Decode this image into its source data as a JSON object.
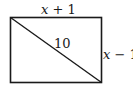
{
  "diagram": {
    "shape": "rectangle-with-diagonal",
    "rectangle": {
      "x": 10.5,
      "y": 17.5,
      "width": 91,
      "height": 65
    },
    "diagonal": {
      "from": "top-left",
      "to": "bottom-right"
    },
    "stroke_color": "#1a1a1a",
    "labels": {
      "top": {
        "var": "x",
        "rest": " + 1",
        "full": "x + 1"
      },
      "diagonal": {
        "text": "10"
      },
      "right": {
        "var": "x",
        "rest": " − 1",
        "full": "x − 1"
      }
    }
  }
}
